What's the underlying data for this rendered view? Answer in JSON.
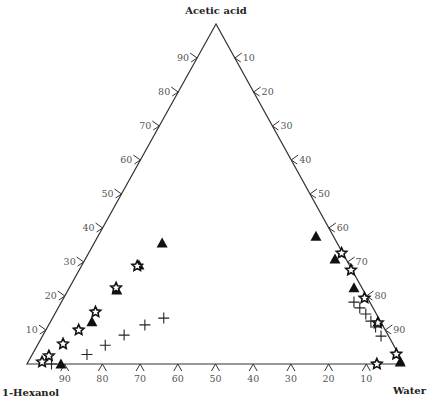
{
  "chart_data": {
    "type": "scatter",
    "subtype": "ternary",
    "title": "",
    "vertices": {
      "top": "Acetic acid",
      "left": "1-Hexanol",
      "right": "Water"
    },
    "axes": {
      "left_side": {
        "component": "Acetic acid",
        "ticks": [
          "10",
          "20",
          "30",
          "40",
          "50",
          "60",
          "70",
          "80",
          "90"
        ]
      },
      "right_side": {
        "component": "Water",
        "ticks": [
          "10",
          "20",
          "30",
          "40",
          "50",
          "60",
          "70",
          "80",
          "90"
        ]
      },
      "bottom_side": {
        "component": "1-Hexanol",
        "ticks": [
          "90",
          "80",
          "70",
          "60",
          "50",
          "40",
          "30",
          "20",
          "10"
        ]
      }
    },
    "units": "mass %",
    "series": [
      {
        "name": "triangles",
        "marker": "filled-triangle",
        "points": [
          {
            "acetic": 35.6,
            "water": 18.0
          },
          {
            "acetic": 29.1,
            "water": 15.1
          },
          {
            "acetic": 21.8,
            "water": 12.9
          },
          {
            "acetic": 12.4,
            "water": 11.0
          },
          {
            "acetic": 0.0,
            "water": 9.0
          },
          {
            "acetic": 37.6,
            "water": 57.8
          },
          {
            "acetic": 30.9,
            "water": 66.2
          },
          {
            "acetic": 22.4,
            "water": 75.5
          },
          {
            "acetic": 12.4,
            "water": 86.9
          },
          {
            "acetic": 0.6,
            "water": 98.7
          }
        ]
      },
      {
        "name": "stars",
        "marker": "open-star",
        "points": [
          {
            "acetic": 22.4,
            "water": 12.4
          },
          {
            "acetic": 28.8,
            "water": 14.8
          },
          {
            "acetic": 15.3,
            "water": 10.5
          },
          {
            "acetic": 10.0,
            "water": 8.7
          },
          {
            "acetic": 5.9,
            "water": 6.6
          },
          {
            "acetic": 2.4,
            "water": 4.6
          },
          {
            "acetic": 0.6,
            "water": 3.7
          },
          {
            "acetic": 32.6,
            "water": 67.1
          },
          {
            "acetic": 27.6,
            "water": 72.1
          },
          {
            "acetic": 19.4,
            "water": 79.8
          },
          {
            "acetic": 12.1,
            "water": 87.0
          },
          {
            "acetic": 2.9,
            "water": 96.5
          },
          {
            "acetic": 0.0,
            "water": 92.8
          }
        ]
      },
      {
        "name": "crosses",
        "marker": "plus",
        "points": [
          {
            "acetic": 13.5,
            "water": 29.5
          },
          {
            "acetic": 11.5,
            "water": 25.5
          },
          {
            "acetic": 8.5,
            "water": 21.5
          },
          {
            "acetic": 5.5,
            "water": 18.0
          },
          {
            "acetic": 2.8,
            "water": 14.5
          },
          {
            "acetic": 0.0,
            "water": 6.5
          },
          {
            "acetic": 18.2,
            "water": 77.6
          },
          {
            "acetic": 16.5,
            "water": 80.0
          },
          {
            "acetic": 14.7,
            "water": 82.5
          },
          {
            "acetic": 12.6,
            "water": 84.9
          },
          {
            "acetic": 10.9,
            "water": 87.0
          },
          {
            "acetic": 8.2,
            "water": 89.8
          }
        ]
      }
    ]
  }
}
